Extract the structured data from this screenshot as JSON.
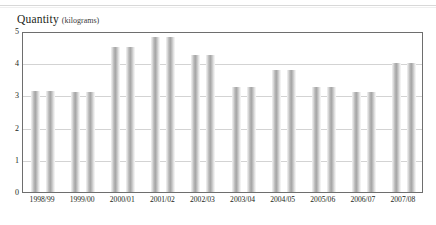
{
  "title": {
    "main": "Quantity",
    "unit": "(kilograms)"
  },
  "chart_data": {
    "type": "bar",
    "xlabel": "",
    "ylabel": "Quantity (kilograms)",
    "ylim": [
      0,
      5
    ],
    "yticks": [
      "0",
      "1",
      "2",
      "3",
      "4",
      "5"
    ],
    "grid": true,
    "legend": "none",
    "bar_style": "paired-columns-same-height",
    "categories": [
      "1998/99",
      "1999/00",
      "2000/01",
      "2001/02",
      "2002/03",
      "2003/04",
      "2004/05",
      "2005/06",
      "2006/07",
      "2007/08"
    ],
    "values": [
      3.15,
      3.1,
      4.5,
      4.8,
      4.25,
      3.25,
      3.8,
      3.25,
      3.1,
      4.0
    ],
    "colors": {
      "bar_mid": "#a8a8a8",
      "bar_edge": "#fafafa",
      "gridline": "#d3d3d3",
      "frame": "#6e6e6e",
      "text": "#231f20"
    }
  }
}
